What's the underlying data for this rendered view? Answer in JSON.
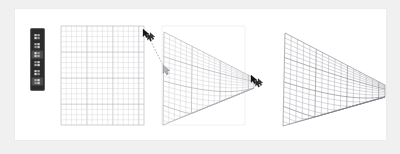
{
  "figure": {
    "title": "Perspective mesh warp — three step sequence",
    "background_color": "#f0f0f0",
    "canvas_color": "#ffffff",
    "canvas_border_color": "#ececec"
  },
  "toolbar": {
    "name": "vertical-tool-palette",
    "background_color": "#2b2b2b",
    "border_color": "#555555",
    "x": 15,
    "y": 19,
    "width": 14,
    "height": 62,
    "items": [
      {
        "icon": "move-tool-icon",
        "label": "Move",
        "active": false
      },
      {
        "icon": "transform-tool-icon",
        "label": "Transform",
        "active": false
      },
      {
        "icon": "warp-tool-icon",
        "label": "Warp",
        "active": true
      },
      {
        "icon": "node-tool-icon",
        "label": "Nodes",
        "active": false
      },
      {
        "icon": "grid-tool-icon",
        "label": "Grid",
        "active": false
      },
      {
        "icon": "mesh-tool-icon",
        "label": "Mesh",
        "active": true
      }
    ]
  },
  "panels": [
    {
      "name": "panel-before",
      "caption": "Undistorted grid",
      "step": 1,
      "x": 46,
      "y": 17,
      "grid": {
        "type": "rectangular",
        "columns": 16,
        "rows": 19,
        "cell_width": 5.2,
        "cell_height": 5.2,
        "minor_color": "#d2d2d6",
        "major_color": "#a8a8ae",
        "major_every": 5,
        "corners": [
          [
            0,
            0
          ],
          [
            83,
            0
          ],
          [
            83,
            99
          ],
          [
            0,
            99
          ]
        ]
      },
      "drag": {
        "name": "drag-arrow",
        "style": "dashed",
        "color": "#888888",
        "start": [
          85,
          6
        ],
        "end": [
          104,
          43
        ],
        "cursor_start_icon": "pointer-cursor-icon",
        "cursor_end_icon": "pointer-cursor-icon"
      }
    },
    {
      "name": "panel-during",
      "caption": "Dragging corner handle",
      "step": 2,
      "x": 147,
      "y": 17,
      "ghost_rect": {
        "name": "original-bounds-outline",
        "color": "#e8e8ec",
        "corners": [
          [
            0,
            0
          ],
          [
            83,
            0
          ],
          [
            83,
            99
          ],
          [
            0,
            99
          ]
        ]
      },
      "grid": {
        "type": "perspective",
        "columns": 16,
        "rows": 19,
        "minor_color": "#c4c4ca",
        "major_color": "#9a9aa2",
        "major_every": 5,
        "corners": [
          [
            2,
            6
          ],
          [
            92,
            52
          ],
          [
            92,
            62
          ],
          [
            1,
            99
          ]
        ]
      },
      "cursor": {
        "name": "drag-cursor",
        "icon": "pointer-cursor-icon",
        "x": 92,
        "y": 52
      }
    },
    {
      "name": "panel-after",
      "caption": "Resulting perspective mesh",
      "step": 3,
      "x": 266,
      "y": 17,
      "grid": {
        "type": "perspective",
        "columns": 16,
        "rows": 19,
        "minor_color": "#9b9ba3",
        "major_color": "#6f6f78",
        "major_every": 5,
        "corners": [
          [
            4,
            7
          ],
          [
            104,
            59
          ],
          [
            104,
            71
          ],
          [
            2,
            100
          ]
        ]
      }
    }
  ]
}
